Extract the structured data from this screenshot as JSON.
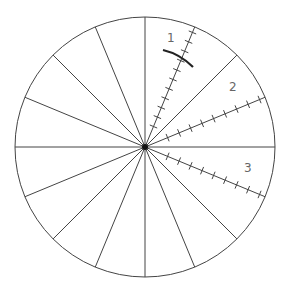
{
  "diagram": {
    "type": "radial-spoke-diagram",
    "center": [
      145,
      147
    ],
    "radius": 130,
    "spoke_count": 16,
    "line_color": "#444444",
    "label_color": "#666666",
    "ticked_spokes": [
      {
        "label": "1",
        "angle_deg": 67.5,
        "ticks": 11,
        "label_pos": [
          167,
          42
        ]
      },
      {
        "label": "2",
        "angle_deg": 22.5,
        "ticks": 9,
        "label_pos": [
          232,
          91
        ]
      },
      {
        "label": "3",
        "angle_deg": -22.5,
        "ticks": 9,
        "label_pos": [
          246,
          172
        ]
      }
    ],
    "arc": {
      "on_spoke": "1",
      "description": "curved mark crossing spoke 1"
    }
  }
}
